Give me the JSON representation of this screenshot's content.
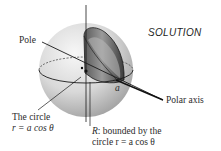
{
  "figure": {
    "heading": "SOLUTION",
    "labels": {
      "pole": "Pole",
      "polar_axis": "Polar axis",
      "point_a": "a",
      "circle_title": "The circle",
      "circle_eq_r": "r",
      "circle_eq_rest": " = a cos θ",
      "region_R": "R",
      "region_line1_rest": ": bounded by the",
      "region_line2": "circle r = a cos θ"
    },
    "colors": {
      "sphere_light": "#f2f2f2",
      "sphere_dark": "#a8a8a8",
      "cylinder_dark": "#4a4a4a",
      "line": "#1a1a1a"
    }
  }
}
